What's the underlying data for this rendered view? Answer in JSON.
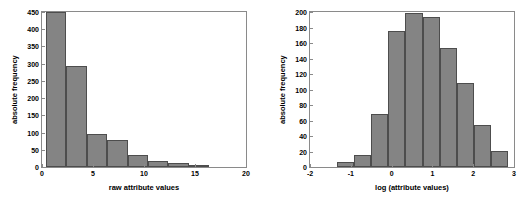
{
  "figure": {
    "background": "#ffffff",
    "bar_fill": "#848484",
    "bar_edge": "#4d4d4d",
    "axis_color": "#8a8a8a"
  },
  "chart_data": [
    {
      "type": "bar",
      "id": "raw-attribute-histogram",
      "title": "",
      "xlabel": "raw attribute values",
      "ylabel": "absolute frequency",
      "xlim": [
        0,
        20
      ],
      "ylim": [
        0,
        450
      ],
      "grid": false,
      "legend": null,
      "xticks": [
        "0",
        "5",
        "10",
        "15",
        "20"
      ],
      "xtick_values": [
        0,
        5,
        10,
        15,
        20
      ],
      "yticks": [
        "0",
        "50",
        "100",
        "150",
        "200",
        "250",
        "300",
        "350",
        "400",
        "450"
      ],
      "ytick_values": [
        0,
        50,
        100,
        150,
        200,
        250,
        300,
        350,
        400,
        450
      ],
      "bin_edges": [
        0.4,
        2.4,
        4.4,
        6.4,
        8.4,
        10.4,
        12.4,
        14.4,
        16.4
      ],
      "categories": [
        "0.4-2.4",
        "2.4-4.4",
        "4.4-6.4",
        "6.4-8.4",
        "8.4-10.4",
        "10.4-12.4",
        "12.4-14.4",
        "14.4-16.4"
      ],
      "values": [
        450,
        292,
        96,
        78,
        35,
        18,
        13,
        7
      ]
    },
    {
      "type": "bar",
      "id": "log-attribute-histogram",
      "title": "",
      "xlabel": "log (attribute values)",
      "ylabel": "absolute frequency",
      "xlim": [
        -2,
        3
      ],
      "ylim": [
        0,
        200
      ],
      "grid": false,
      "legend": null,
      "xticks": [
        "-2",
        "-1",
        "0",
        "1",
        "2",
        "3"
      ],
      "xtick_values": [
        -2,
        -1,
        0,
        1,
        2,
        3
      ],
      "yticks": [
        "0",
        "20",
        "40",
        "60",
        "80",
        "100",
        "120",
        "140",
        "160",
        "180",
        "200"
      ],
      "ytick_values": [
        0,
        20,
        40,
        60,
        80,
        100,
        120,
        140,
        160,
        180,
        200
      ],
      "bin_edges": [
        -1.34,
        -0.92,
        -0.5,
        -0.08,
        0.34,
        0.76,
        1.18,
        1.6,
        2.02,
        2.44,
        2.86
      ],
      "categories": [
        "-1.34--0.92",
        "-0.92--0.5",
        "-0.5--0.08",
        "-0.08-0.34",
        "0.34-0.76",
        "0.76-1.18",
        "1.18-1.6",
        "1.6-2.02",
        "2.02-2.44",
        "2.44-2.86"
      ],
      "values": [
        6,
        16,
        69,
        175,
        199,
        193,
        154,
        108,
        54,
        21
      ]
    }
  ]
}
